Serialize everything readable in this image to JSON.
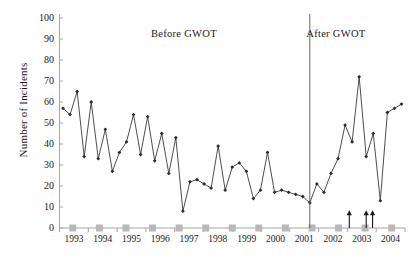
{
  "chart_data": {
    "type": "line",
    "title": "",
    "xlabel": "",
    "ylabel": "Number of Incidents",
    "ylim": [
      0,
      100
    ],
    "ytick_values": [
      0,
      10,
      20,
      30,
      40,
      50,
      60,
      70,
      80,
      90,
      100
    ],
    "xtick_labels": [
      "1993",
      "1994",
      "1995",
      "1996",
      "1997",
      "1998",
      "1999",
      "2000",
      "2001",
      "2002",
      "2003",
      "2004"
    ],
    "grid": false,
    "legend": "none",
    "annotations": [
      {
        "text": "Before  GWOT",
        "x_frac": 0.36,
        "y_value": 92
      },
      {
        "text": "After  GWOT",
        "x_frac": 0.8,
        "y_value": 92
      }
    ],
    "divider": {
      "label": "GWOT start",
      "x_index": 35.0
    },
    "arrows": [
      {
        "x_index": 40.6,
        "from": 0,
        "to": 8
      },
      {
        "x_index": 43.0,
        "from": 0,
        "to": 8
      },
      {
        "x_index": 43.9,
        "from": 0,
        "to": 8
      }
    ],
    "series": [
      {
        "name": "Incidents",
        "color": "#3a3a3a",
        "marker": "diamond",
        "values": [
          57,
          54,
          65,
          34,
          60,
          33,
          47,
          27,
          36,
          41,
          54,
          35,
          53,
          32,
          45,
          26,
          43,
          8,
          22,
          23,
          21,
          19,
          39,
          18,
          29,
          31,
          27,
          14,
          18,
          36,
          17,
          18,
          17,
          16,
          15,
          12,
          21,
          17,
          26,
          33,
          49,
          41,
          72,
          34,
          45,
          13,
          55,
          57,
          59
        ]
      },
      {
        "name": "Baseline markers",
        "color": "#b8b8b8",
        "marker": "square",
        "values": [
          0,
          0,
          0,
          0,
          0,
          0,
          0,
          0,
          0,
          0,
          0,
          0,
          0
        ]
      }
    ]
  }
}
